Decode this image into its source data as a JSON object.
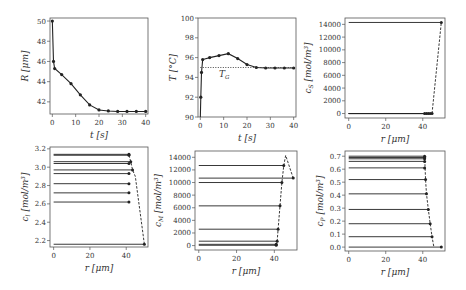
{
  "chart_data": [
    {
      "id": "R",
      "type": "line",
      "xlabel": "t [s]",
      "ylabel": "R [μm]",
      "xticks": [
        0,
        10,
        20,
        30,
        40
      ],
      "yticks": [
        42,
        44,
        46,
        48,
        50
      ],
      "xlim": [
        -1,
        41
      ],
      "ylim": [
        40.8,
        50.3
      ],
      "box": {
        "x": 50,
        "y": 18,
        "w": 98,
        "h": 96
      },
      "series": [
        {
          "name": "R(t)",
          "style": "solid-marker",
          "x": [
            0,
            0.5,
            1,
            4,
            8,
            12,
            16,
            20,
            24,
            28,
            32,
            36,
            40
          ],
          "y": [
            50,
            46,
            45.3,
            44.7,
            43.8,
            42.7,
            41.7,
            41.2,
            41.1,
            41.05,
            41.05,
            41.05,
            41.05
          ]
        }
      ]
    },
    {
      "id": "T",
      "type": "line",
      "xlabel": "t [s]",
      "ylabel": "T [°C]",
      "xticks": [
        0,
        10,
        20,
        30,
        40
      ],
      "yticks": [
        90,
        92,
        94,
        96,
        98,
        100
      ],
      "xlim": [
        -1,
        41
      ],
      "ylim": [
        90,
        100
      ],
      "box": {
        "x": 198,
        "y": 18,
        "w": 98,
        "h": 99
      },
      "annotation": {
        "text": "T_G",
        "value": 95
      },
      "series": [
        {
          "name": "T(t)",
          "style": "solid-marker",
          "x": [
            0,
            0.2,
            0.5,
            1,
            4,
            8,
            12,
            16,
            20,
            24,
            28,
            32,
            36,
            40
          ],
          "y": [
            90,
            92,
            94.5,
            95.8,
            96.0,
            96.2,
            96.4,
            95.9,
            95.3,
            95.0,
            94.95,
            94.95,
            94.95,
            94.95
          ]
        },
        {
          "name": "T_G",
          "style": "dotted",
          "x": [
            0,
            40
          ],
          "y": [
            95,
            95
          ]
        }
      ]
    },
    {
      "id": "cS",
      "type": "line",
      "xlabel": "r [μm]",
      "ylabel": "c_S [mol/m³]",
      "xticks": [
        0,
        20,
        40
      ],
      "yticks": [
        0,
        2000,
        4000,
        6000,
        8000,
        10000,
        12000,
        14000
      ],
      "xlim": [
        -2,
        52
      ],
      "ylim": [
        -700,
        15000
      ],
      "box": {
        "x": 345,
        "y": 18,
        "w": 100,
        "h": 100
      },
      "profiles": [
        {
          "r_end": 50,
          "value": 14300
        },
        {
          "r_end": 41,
          "value": 0
        },
        {
          "r_end": 42,
          "value": 0
        },
        {
          "r_end": 43,
          "value": 0
        },
        {
          "r_end": 44,
          "value": 0
        },
        {
          "r_end": 45,
          "value": 0
        }
      ],
      "interface": {
        "r": [
          45,
          50
        ],
        "value": [
          0,
          14300
        ]
      }
    },
    {
      "id": "cl",
      "type": "line",
      "xlabel": "r [μm]",
      "ylabel": "c_l [mol/m³]",
      "xticks": [
        0,
        20,
        40
      ],
      "yticks": [
        2.2,
        2.4,
        2.6,
        2.8,
        3.0,
        3.2
      ],
      "xlim": [
        -2,
        52
      ],
      "ylim": [
        2.13,
        3.22
      ],
      "box": {
        "x": 50,
        "y": 147,
        "w": 98,
        "h": 100
      },
      "profiles": [
        {
          "r_end": 41.5,
          "value": 3.14
        },
        {
          "r_end": 41.5,
          "value": 3.13
        },
        {
          "r_end": 42.5,
          "value": 3.06
        },
        {
          "r_end": 41.5,
          "value": 3.04
        },
        {
          "r_end": 43.5,
          "value": 2.97
        },
        {
          "r_end": 41.5,
          "value": 2.93
        },
        {
          "r_end": 41.5,
          "value": 2.82
        },
        {
          "r_end": 41.5,
          "value": 2.72
        },
        {
          "r_end": 41.5,
          "value": 2.62
        },
        {
          "r_end": 50,
          "value": 2.16
        }
      ],
      "interface": {
        "r": [
          41.5,
          42.5,
          43.5,
          45,
          50
        ],
        "value": [
          3.13,
          3.06,
          2.97,
          2.9,
          2.16
        ]
      }
    },
    {
      "id": "cM",
      "type": "line",
      "xlabel": "r [μm]",
      "ylabel": "c_M [mol/m³]",
      "xticks": [
        0,
        20,
        40
      ],
      "yticks": [
        0,
        2000,
        4000,
        6000,
        8000,
        10000,
        12000,
        14000
      ],
      "xlim": [
        -2,
        52
      ],
      "ylim": [
        -700,
        15000
      ],
      "box": {
        "x": 195,
        "y": 151,
        "w": 102,
        "h": 99
      },
      "profiles": [
        {
          "r_end": 45,
          "value": 12700
        },
        {
          "r_end": 50,
          "value": 10700
        },
        {
          "r_end": 44,
          "value": 10000
        },
        {
          "r_end": 43,
          "value": 6300
        },
        {
          "r_end": 42,
          "value": 2600
        },
        {
          "r_end": 41.5,
          "value": 700
        },
        {
          "r_end": 41,
          "value": 200
        },
        {
          "r_end": 41,
          "value": 50
        }
      ],
      "interface": {
        "r": [
          41,
          41.5,
          42,
          43,
          44,
          45,
          46,
          50
        ],
        "value": [
          50,
          700,
          2600,
          6300,
          10000,
          12700,
          14300,
          10700
        ]
      }
    },
    {
      "id": "cP",
      "type": "line",
      "xlabel": "r [μm]",
      "ylabel": "c_P [mol/m³]",
      "xticks": [
        0,
        20,
        40
      ],
      "yticks": [
        0.0,
        0.1,
        0.2,
        0.3,
        0.4,
        0.5,
        0.6,
        0.7
      ],
      "xlim": [
        -2,
        52
      ],
      "ylim": [
        -0.03,
        0.74
      ],
      "box": {
        "x": 345,
        "y": 151,
        "w": 100,
        "h": 100
      },
      "profiles": [
        {
          "r_end": 41,
          "value": 0.7
        },
        {
          "r_end": 41,
          "value": 0.69
        },
        {
          "r_end": 41,
          "value": 0.68
        },
        {
          "r_end": 41,
          "value": 0.66
        },
        {
          "r_end": 41,
          "value": 0.61
        },
        {
          "r_end": 41.5,
          "value": 0.52
        },
        {
          "r_end": 42,
          "value": 0.41
        },
        {
          "r_end": 43,
          "value": 0.29
        },
        {
          "r_end": 44,
          "value": 0.18
        },
        {
          "r_end": 45,
          "value": 0.08
        },
        {
          "r_end": 50,
          "value": 0.0
        }
      ],
      "interface": {
        "r": [
          41,
          41.5,
          42,
          43,
          44,
          45,
          46
        ],
        "value": [
          0.7,
          0.52,
          0.41,
          0.29,
          0.18,
          0.08,
          0.0
        ]
      }
    }
  ],
  "labels": {
    "R_y": "R [μm]",
    "R_x": "t [s]",
    "T_y": "T [°C]",
    "T_x": "t [s]",
    "T_G": "T",
    "T_G_sub": "G",
    "cS_y": "c",
    "cS_sub": "S",
    "cS_unit": " [mol/m³]",
    "cS_x": "r [μm]",
    "cl_y": "c",
    "cl_sub": "l",
    "cl_unit": " [mol/m³]",
    "cl_x": "r [μm]",
    "cM_y": "c",
    "cM_sub": "M",
    "cM_unit": " [mol/m³]",
    "cM_x": "r [μm]",
    "cP_y": "c",
    "cP_sub": "P",
    "cP_unit": " [mol/m³]",
    "cP_x": "r [μm]"
  }
}
